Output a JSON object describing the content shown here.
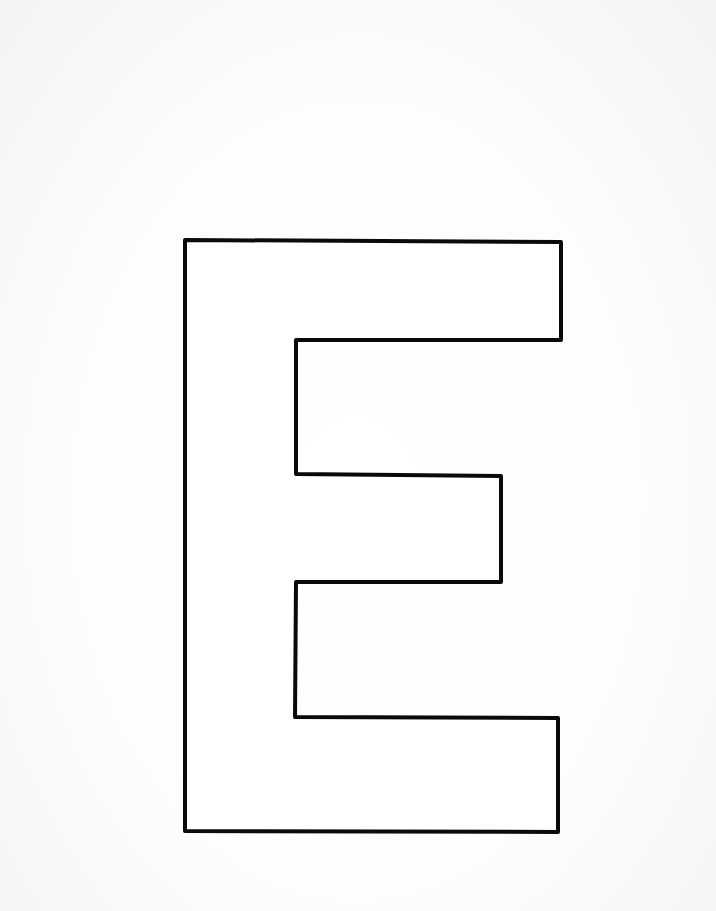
{
  "page": {
    "background_color": "#fbfbfb",
    "edge_shade_color": "#f4f4f4"
  },
  "letter": {
    "character": "E",
    "style": "outline",
    "stroke_color": "#0a0a0a",
    "fill_color": "#ffffff",
    "stroke_width": 4,
    "outline_points": [
      [
        185,
        240
      ],
      [
        561,
        242
      ],
      [
        561,
        340
      ],
      [
        296,
        340
      ],
      [
        296,
        474
      ],
      [
        501,
        476
      ],
      [
        501,
        582
      ],
      [
        296,
        582
      ],
      [
        295,
        717
      ],
      [
        558,
        718
      ],
      [
        558,
        832
      ],
      [
        185,
        831
      ]
    ]
  }
}
